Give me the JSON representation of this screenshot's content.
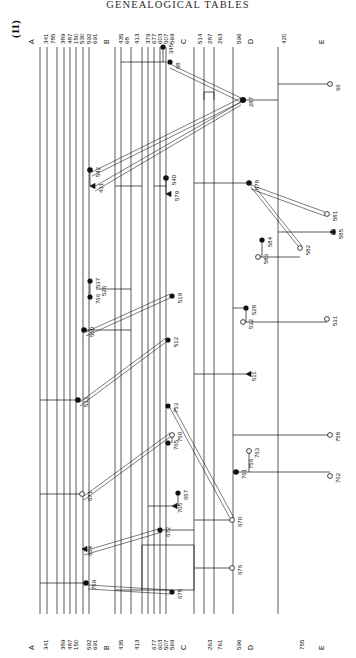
{
  "document": {
    "running_head": "GENEALOGICAL TABLES",
    "plate_number": "(11)"
  },
  "axis": {
    "groups": [
      {
        "letter": "A",
        "x": 28,
        "labels": [
          {
            "text": "341",
            "x": 40
          },
          {
            "text": "785",
            "x": 47
          },
          {
            "text": "389",
            "x": 57
          },
          {
            "text": "487",
            "x": 64
          },
          {
            "text": "150",
            "x": 70
          },
          {
            "text": "530",
            "x": 76
          },
          {
            "text": "592",
            "x": 83
          },
          {
            "text": "691",
            "x": 89
          }
        ]
      },
      {
        "letter": "B",
        "x": 103,
        "labels": [
          {
            "text": "435",
            "x": 115
          },
          {
            "text": "68",
            "x": 121
          },
          {
            "text": "413",
            "x": 131
          },
          {
            "text": "379",
            "x": 142
          },
          {
            "text": "677",
            "x": 148
          },
          {
            "text": "603",
            "x": 154
          },
          {
            "text": "507",
            "x": 160
          },
          {
            "text": "569",
            "x": 166
          }
        ]
      },
      {
        "letter": "C",
        "x": 180,
        "labels": [
          {
            "text": "514",
            "x": 194
          },
          {
            "text": "287",
            "x": 204
          },
          {
            "text": "263",
            "x": 214
          },
          {
            "text": "596",
            "x": 233
          }
        ]
      },
      {
        "letter": "D",
        "x": 247,
        "labels": [
          {
            "text": "420",
            "x": 278
          }
        ]
      },
      {
        "letter": "E",
        "x": 318,
        "labels": []
      }
    ],
    "bottom_groups": [
      {
        "letter": "A",
        "x": 28,
        "labels": [
          {
            "text": "341",
            "x": 40
          },
          {
            "text": "389",
            "x": 57
          },
          {
            "text": "487",
            "x": 64
          },
          {
            "text": "150",
            "x": 70
          },
          {
            "text": "592",
            "x": 83
          },
          {
            "text": "691",
            "x": 89
          }
        ]
      },
      {
        "letter": "B",
        "x": 103,
        "labels": [
          {
            "text": "435",
            "x": 115
          },
          {
            "text": "413",
            "x": 131
          },
          {
            "text": "677",
            "x": 148
          },
          {
            "text": "603",
            "x": 154
          },
          {
            "text": "507",
            "x": 160
          },
          {
            "text": "569",
            "x": 166
          }
        ]
      },
      {
        "letter": "C",
        "x": 180,
        "labels": [
          {
            "text": "263",
            "x": 204
          },
          {
            "text": "761",
            "x": 214
          },
          {
            "text": "596",
            "x": 233
          }
        ]
      },
      {
        "letter": "D",
        "x": 247,
        "labels": []
      },
      {
        "letter": "E",
        "x": 318,
        "labels": [
          {
            "text": "755",
            "x": 296
          }
        ]
      }
    ]
  },
  "chart_data": {
    "type": "diagram",
    "node_labels": [
      {
        "id": "345",
        "x": 163,
        "y": 47,
        "marker": "filled"
      },
      {
        "id": "68",
        "x": 170,
        "y": 62,
        "marker": "filled"
      },
      {
        "id": "287",
        "x": 243,
        "y": 100,
        "marker": "filled"
      },
      {
        "id": "66",
        "x": 330,
        "y": 84,
        "marker": "open"
      },
      {
        "id": "542",
        "x": 90,
        "y": 170,
        "marker": "filled"
      },
      {
        "id": "431",
        "x": 93,
        "y": 186,
        "marker": "arrow"
      },
      {
        "id": "540",
        "x": 166,
        "y": 178,
        "marker": "filled"
      },
      {
        "id": "579",
        "x": 169,
        "y": 194,
        "marker": "arrow"
      },
      {
        "id": "578",
        "x": 249,
        "y": 183,
        "marker": "filled"
      },
      {
        "id": "581",
        "x": 327,
        "y": 214,
        "marker": "open"
      },
      {
        "id": "585",
        "x": 333,
        "y": 232,
        "marker": "open"
      },
      {
        "id": "582",
        "x": 300,
        "y": 248,
        "marker": "open"
      },
      {
        "id": "584",
        "x": 262,
        "y": 240,
        "marker": "filled"
      },
      {
        "id": "583",
        "x": 258,
        "y": 257,
        "marker": "open"
      },
      {
        "id": "537",
        "x": 90,
        "y": 281,
        "marker": "filled"
      },
      {
        "id": "526",
        "x": 96,
        "y": 289,
        "marker": "tick"
      },
      {
        "id": "766",
        "x": 90,
        "y": 297,
        "marker": "filled"
      },
      {
        "id": "519",
        "x": 172,
        "y": 296,
        "marker": "filled"
      },
      {
        "id": "550",
        "x": 84,
        "y": 330,
        "marker": "filled"
      },
      {
        "id": "512",
        "x": 168,
        "y": 340,
        "marker": "filled"
      },
      {
        "id": "528",
        "x": 246,
        "y": 308,
        "marker": "filled"
      },
      {
        "id": "532",
        "x": 243,
        "y": 322,
        "marker": "open"
      },
      {
        "id": "531",
        "x": 327,
        "y": 319,
        "marker": "open"
      },
      {
        "id": "511",
        "x": 246,
        "y": 374,
        "marker": "arrow"
      },
      {
        "id": "533",
        "x": 78,
        "y": 400,
        "marker": "filled"
      },
      {
        "id": "753",
        "x": 168,
        "y": 406,
        "marker": "filled"
      },
      {
        "id": "750",
        "x": 172,
        "y": 435,
        "marker": "open"
      },
      {
        "id": "765",
        "x": 168,
        "y": 443,
        "marker": "filled"
      },
      {
        "id": "758",
        "x": 330,
        "y": 435,
        "marker": "open"
      },
      {
        "id": "763",
        "x": 249,
        "y": 451,
        "marker": "open"
      },
      {
        "id": "756",
        "x": 243,
        "y": 462,
        "marker": "tick"
      },
      {
        "id": "761",
        "x": 236,
        "y": 472,
        "marker": "filled"
      },
      {
        "id": "762",
        "x": 330,
        "y": 476,
        "marker": "open"
      },
      {
        "id": "671",
        "x": 82,
        "y": 494,
        "marker": "open"
      },
      {
        "id": "657",
        "x": 178,
        "y": 493,
        "marker": "filled"
      },
      {
        "id": "705",
        "x": 172,
        "y": 506,
        "marker": "arrow"
      },
      {
        "id": "672",
        "x": 160,
        "y": 530,
        "marker": "filled"
      },
      {
        "id": "670",
        "x": 232,
        "y": 520,
        "marker": "open"
      },
      {
        "id": "654",
        "x": 82,
        "y": 549,
        "marker": "arrow"
      },
      {
        "id": "676",
        "x": 232,
        "y": 568,
        "marker": "open"
      },
      {
        "id": "759",
        "x": 86,
        "y": 583,
        "marker": "filled"
      },
      {
        "id": "675",
        "x": 172,
        "y": 592,
        "marker": "filled"
      }
    ]
  }
}
